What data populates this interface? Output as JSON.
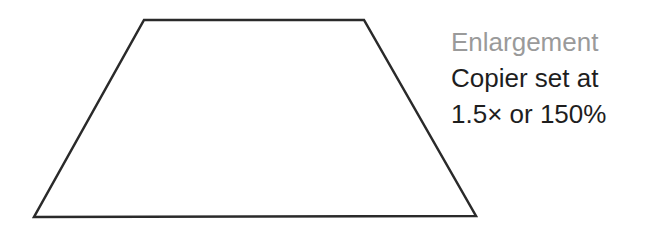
{
  "diagram": {
    "shape": {
      "type": "trapezoid",
      "points": [
        [
          144,
          20
        ],
        [
          364,
          20
        ],
        [
          476,
          216
        ],
        [
          34,
          217
        ]
      ],
      "stroke": "#2a2a2a",
      "stroke_width": 2.5,
      "fill": "#ffffff"
    },
    "caption": {
      "title": "Enlargement",
      "lines": [
        "Copier set at",
        "1.5× or 150%"
      ],
      "title_color": "#9a9a9a",
      "text_color": "#1e1e1e"
    }
  }
}
